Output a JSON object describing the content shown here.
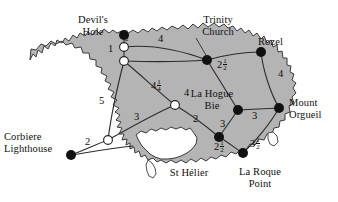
{
  "map": {
    "title": "Jersey road network distance map",
    "island_fill": "#b4b4b4",
    "island_stroke": "#3a3a3a",
    "background": "#ffffff",
    "edge_color": "#2b2b2b",
    "terminal_node_fill": "#111111",
    "junction_node_fill": "#ffffff",
    "junction_node_stroke": "#222222"
  },
  "places": [
    {
      "id": "devils-hole",
      "name": "Devil's\nHole",
      "label_x": 62,
      "label_y": 14,
      "label_w": 62,
      "node_x": 124,
      "node_y": 35,
      "type": "terminal"
    },
    {
      "id": "trinity-church",
      "name": "Trinity\nChurch",
      "label_x": 186,
      "label_y": 14,
      "label_w": 64,
      "node_x": 207,
      "node_y": 60,
      "type": "terminal"
    },
    {
      "id": "rozel",
      "name": "Rozel",
      "label_x": 258,
      "label_y": 36,
      "label_w": 42,
      "node_x": 261,
      "node_y": 52,
      "type": "terminal"
    },
    {
      "id": "mount-orgueil",
      "name": "Mount\nOrgueil",
      "label_x": 289,
      "label_y": 97,
      "label_w": 48,
      "node_x": 279,
      "node_y": 108,
      "type": "terminal"
    },
    {
      "id": "la-hogue-bie",
      "name": "La Hogue\nBie",
      "label_x": 186,
      "label_y": 88,
      "label_w": 52,
      "node_x": 238,
      "node_y": 110,
      "type": "terminal"
    },
    {
      "id": "la-roque-point",
      "name": "La Roque\nPoint",
      "label_x": 234,
      "label_y": 166,
      "label_w": 56,
      "node_x": 243,
      "node_y": 153,
      "type": "terminal"
    },
    {
      "id": "st-helier",
      "name": "St Hélier",
      "label_x": 163,
      "label_y": 167,
      "label_w": 52,
      "node_x": 219,
      "node_y": 137,
      "type": "terminal"
    },
    {
      "id": "corbiere-lighthouse",
      "name": "Corbiere\nLighthouse",
      "label_x": 6,
      "label_y": 131,
      "label_w": 68,
      "node_x": 71,
      "node_y": 155,
      "type": "terminal"
    },
    {
      "id": "junction-north",
      "name": "junction-north",
      "node_x": 124,
      "node_y": 47,
      "type": "junction"
    },
    {
      "id": "junction-upper",
      "name": "junction-upper",
      "node_x": 124,
      "node_y": 61,
      "type": "junction"
    },
    {
      "id": "junction-center",
      "name": "junction-center",
      "node_x": 175,
      "node_y": 105,
      "type": "junction"
    },
    {
      "id": "junction-southwest",
      "name": "junction-southwest",
      "node_x": 108,
      "node_y": 140,
      "type": "junction"
    }
  ],
  "edges": [
    {
      "id": "devils-hole--junction-north",
      "from": "devils-hole",
      "to": "junction-north",
      "weight": "½",
      "whole": "",
      "num": "1",
      "den": "2",
      "label_x": 127,
      "label_y": 34,
      "vertical": true
    },
    {
      "id": "junction-north--junction-upper",
      "from": "junction-north",
      "to": "junction-upper",
      "weight": "1",
      "whole": "1",
      "num": "",
      "den": "",
      "label_x": 111,
      "label_y": 49,
      "vertical": false
    },
    {
      "id": "junction-north--trinity",
      "from": "junction-north",
      "to": "trinity-church",
      "weight": "4",
      "whole": "4",
      "num": "",
      "den": "",
      "label_x": 160,
      "label_y": 39,
      "vertical": false
    },
    {
      "id": "junction-upper--trinity",
      "from": "junction-upper",
      "to": "trinity-church",
      "weight": "4",
      "whole": "4",
      "num": "",
      "den": "",
      "label_x": 186,
      "label_y": 93,
      "vertical": false
    },
    {
      "id": "trinity--rozel",
      "from": "trinity-church",
      "to": "rozel",
      "weight": "2½",
      "whole": "2",
      "num": "1",
      "den": "2",
      "label_x": 222,
      "label_y": 64,
      "vertical": false
    },
    {
      "id": "rozel--mount-orgueil",
      "from": "rozel",
      "to": "mount-orgueil",
      "weight": "4",
      "whole": "4",
      "num": "",
      "den": "",
      "label_x": 263,
      "label_y": 74,
      "vertical": false
    },
    {
      "id": "junction-upper--center",
      "from": "junction-upper",
      "to": "junction-center",
      "weight": "4¼",
      "whole": "4",
      "num": "1",
      "den": "4",
      "label_x": 156,
      "label_y": 85,
      "vertical": false
    },
    {
      "id": "junction-upper--southwest",
      "from": "junction-upper",
      "to": "junction-southwest",
      "weight": "5",
      "whole": "5",
      "num": "",
      "den": "",
      "label_x": 102,
      "label_y": 101,
      "vertical": false
    },
    {
      "id": "center--southwest",
      "from": "junction-center",
      "to": "junction-southwest",
      "weight": "3",
      "whole": "3",
      "num": "",
      "den": "",
      "label_x": 137,
      "label_y": 117,
      "vertical": false
    },
    {
      "id": "center--st-helier",
      "from": "junction-center",
      "to": "st-helier",
      "weight": "2",
      "whole": "2",
      "num": "",
      "den": "",
      "label_x": 196,
      "label_y": 119,
      "vertical": false
    },
    {
      "id": "southwest--corbiere",
      "from": "junction-southwest",
      "to": "corbiere-lighthouse",
      "weight": "2",
      "whole": "2",
      "num": "",
      "den": "",
      "label_x": 88,
      "label_y": 142,
      "vertical": false
    },
    {
      "id": "la-hogue-bie--mount-orgueil",
      "from": "la-hogue-bie",
      "to": "mount-orgueil",
      "weight": "3",
      "whole": "3",
      "num": "",
      "den": "",
      "label_x": 254,
      "label_y": 116,
      "vertical": false
    },
    {
      "id": "la-hogue-bie--st-helier",
      "from": "la-hogue-bie",
      "to": "st-helier",
      "weight": "3",
      "whole": "3",
      "num": "",
      "den": "",
      "label_x": 222,
      "label_y": 124,
      "vertical": false
    },
    {
      "id": "st-helier--la-roque",
      "from": "st-helier",
      "to": "la-roque-point",
      "weight": "2½",
      "whole": "2",
      "num": "1",
      "den": "2",
      "label_x": 218,
      "label_y": 146,
      "vertical": false
    },
    {
      "id": "la-roque--mount-orgueil",
      "from": "la-roque-point",
      "to": "mount-orgueil",
      "weight": "3½",
      "whole": "3",
      "num": "1",
      "den": "2",
      "label_x": 255,
      "label_y": 142,
      "vertical": false
    }
  ],
  "graph_summary": {
    "terminal_count": "8",
    "junction_count": "4",
    "edge_count": "15"
  }
}
